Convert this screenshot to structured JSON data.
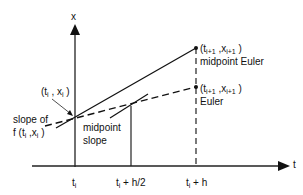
{
  "axes": {
    "y_label": "x",
    "x_label": "t"
  },
  "points": {
    "start": {
      "label": "(t_i , x_i)",
      "t": "t_i",
      "x": "x_i"
    },
    "midpoint_euler": {
      "label": "(t_i+1 , x_i+1)",
      "caption": "midpoint Euler"
    },
    "euler": {
      "label": "(t_i+1 , x_i+1)",
      "caption": "Euler"
    }
  },
  "annotations": {
    "slope_of_line1": "slope of",
    "slope_of_line2": "f (t_i ,x_i )",
    "midpoint_slope_line1": "midpoint",
    "midpoint_slope_line2": "slope"
  },
  "ticks": {
    "t0": "t_i",
    "t_half": "t_i + h/2",
    "t_full": "t_i + h"
  },
  "text": {
    "x_axis": "x",
    "t_axis": "t",
    "start_open": "(t",
    "start_sub_i": "i",
    "start_mid": " , x",
    "start_sub_i2": "i",
    "start_close": " )",
    "end_open": "(t",
    "end_sub": "i+1",
    "end_mid": " ,x",
    "end_sub2": "i+1",
    "end_close": " )",
    "midpoint_euler": "midpoint Euler",
    "euler": "Euler",
    "slope_of": "slope of",
    "f_open": "f (t",
    "f_sub": "i",
    "f_mid": " ,x",
    "f_sub2": "i",
    "f_close": " )",
    "midpoint": "midpoint",
    "slope": "slope",
    "tick_t": "t",
    "tick_sub": "i",
    "tick_half_rest": " + h/2",
    "tick_full_rest": " + h"
  },
  "colors": {
    "ink": "#111111",
    "background": "#ffffff"
  }
}
